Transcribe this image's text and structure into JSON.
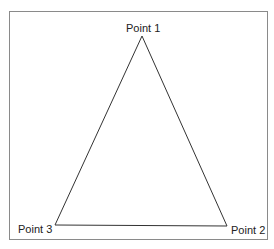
{
  "diagram": {
    "type": "triangle",
    "points": [
      {
        "id": 1,
        "label": "Point 1",
        "x": 142,
        "y": 36
      },
      {
        "id": 2,
        "label": "Point 2",
        "x": 227,
        "y": 226
      },
      {
        "id": 3,
        "label": "Point 3",
        "x": 55,
        "y": 225
      }
    ],
    "edges": [
      [
        1,
        2
      ],
      [
        2,
        3
      ],
      [
        3,
        1
      ]
    ],
    "colors": {
      "stroke": "#333333",
      "frame": "#8a8a8a",
      "background": "#ffffff"
    }
  }
}
